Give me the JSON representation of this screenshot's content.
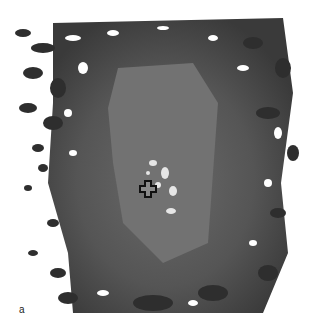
{
  "figure": {
    "panel_label": "a",
    "marker": {
      "type": "crosshair",
      "x": 147,
      "y": 188
    },
    "colors": {
      "outer_dark": "#3a3a3a",
      "mid_gray": "#5e5e5e",
      "core_gray": "#7a7a7a",
      "bright_spots": "#e8e8e8",
      "background": "#ffffff"
    }
  }
}
